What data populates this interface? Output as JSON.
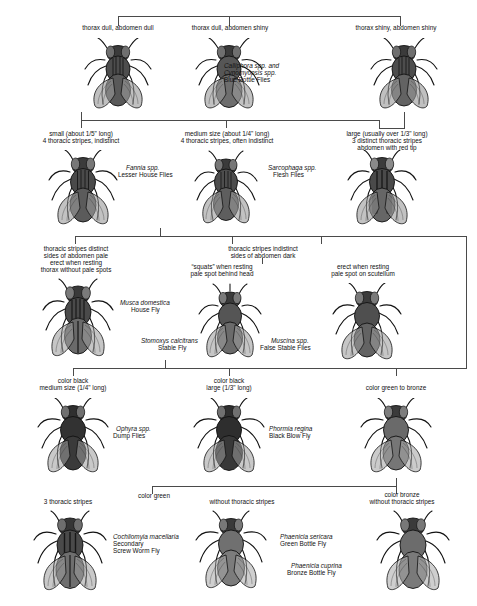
{
  "diagram": {
    "type": "dichotomous-key",
    "line_color": "#4a4a4a",
    "text_color": "#111111"
  },
  "levels": [
    {
      "id": "level-1",
      "branches": [
        {
          "id": "branch-thorax-dull-abdomen-dull",
          "condition": [
            "thorax dull, abdomen dull"
          ],
          "species": null,
          "common": null
        },
        {
          "id": "branch-thorax-dull-abdomen-shiny",
          "condition": [
            "thorax dull, abdomen shiny"
          ],
          "species": [
            "Calliphora spp. and",
            "Cynomyopsis spp."
          ],
          "common": [
            "Blue Bottle Flies"
          ]
        },
        {
          "id": "branch-thorax-shiny-abdomen-shiny",
          "condition": [
            "thorax shiny, abdomen shiny"
          ],
          "species": null,
          "common": null
        }
      ]
    },
    {
      "id": "level-2",
      "branches": [
        {
          "id": "branch-small-fannia",
          "condition": [
            "small (about 1/5\" long)",
            "4 thoracic stripes, indistinct"
          ],
          "species": [
            "Fannia spp."
          ],
          "common": [
            "Lesser House Flies"
          ]
        },
        {
          "id": "branch-medium-four-stripes",
          "condition": [
            "medium size (about 1/4\" long)",
            "4 thoracic stripes, often indistinct"
          ],
          "species": null,
          "common": null
        },
        {
          "id": "branch-large-sarcophaga",
          "condition": [
            "large (usually over 1/3\" long)",
            "3 distinct thoracic stripes",
            "abdomen with red tip"
          ],
          "species": [
            "Sarcophaga spp."
          ],
          "common": [
            "Flesh Flies"
          ]
        }
      ]
    },
    {
      "id": "level-3",
      "branches": [
        {
          "id": "branch-musca-domestica",
          "condition": [
            "thoracic stripes distinct",
            "sides of abdomen pale",
            "erect when resting",
            "thorax without pale spots"
          ],
          "species": [
            "Musca domestica"
          ],
          "common": [
            "House Fly"
          ]
        },
        {
          "id": "branch-stomoxys",
          "condition": [
            "“squats” when resting",
            "pale spot behind head"
          ],
          "species": [
            "Stomoxys calcitrans"
          ],
          "common": [
            "Stable Fly"
          ]
        },
        {
          "id": "branch-muscina",
          "condition": [
            "erect when resting",
            "pale spot on scutellum"
          ],
          "species": [
            "Muscina spp."
          ],
          "common": [
            "False Stable Flies"
          ]
        }
      ],
      "group_conditions": [
        {
          "id": "group-stripes-indistinct",
          "lines": [
            "thoracic stripes indistinct",
            "sides of abdomen dark"
          ]
        }
      ]
    },
    {
      "id": "level-4",
      "branches": [
        {
          "id": "branch-ophyra",
          "condition": [
            "color black",
            "medium size (1/4\" long)"
          ],
          "species": [
            "Ophyra spp."
          ],
          "common": [
            "Dump Flies"
          ]
        },
        {
          "id": "branch-phormia",
          "condition": [
            "color black",
            "large (1/3\" long)"
          ],
          "species": [
            "Phormia regina"
          ],
          "common": [
            "Black Blow Fly"
          ]
        },
        {
          "id": "branch-green-to-bronze",
          "condition": [
            "color green to bronze"
          ],
          "species": null,
          "common": null
        }
      ]
    },
    {
      "id": "level-5",
      "branches": [
        {
          "id": "branch-cochliomyia",
          "condition": [
            "3 thoracic stripes"
          ],
          "species": [
            "Cochliomyia macellaria"
          ],
          "common": [
            "Secondary",
            "Screw Worm Fly"
          ]
        },
        {
          "id": "branch-phaenicia-sericara",
          "condition": [
            "without thoracic stripes"
          ],
          "species": [
            "Phaenicia sericara"
          ],
          "common": [
            "Green Bottle Fly"
          ]
        },
        {
          "id": "branch-phaenicia-cuprina",
          "condition": [
            "color bronze",
            "without thoracic stripes"
          ],
          "species": [
            "Phaenicia cuprina"
          ],
          "common": [
            "Bronze Bottle Fly"
          ]
        }
      ],
      "group_conditions": [
        {
          "id": "group-color-green",
          "lines": [
            "color green"
          ]
        }
      ]
    }
  ]
}
